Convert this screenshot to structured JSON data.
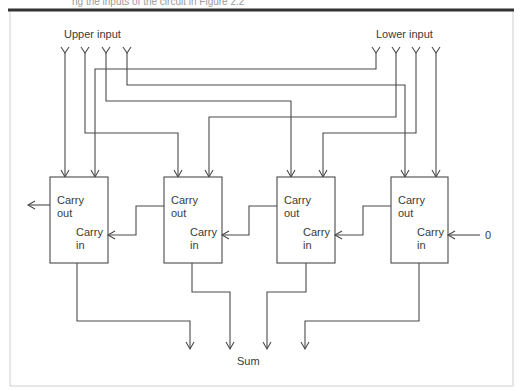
{
  "caption": "ng the inputs of the circuit in Figure 2.2",
  "labels": {
    "upper_input": "Upper input",
    "lower_input": "Lower input",
    "sum": "Sum",
    "carry_in_zero": "0"
  },
  "adders": [
    {
      "carry_out": "Carry",
      "carry_out2": "out",
      "carry_in": "Carry",
      "carry_in2": "in"
    },
    {
      "carry_out": "Carry",
      "carry_out2": "out",
      "carry_in": "Carry",
      "carry_in2": "in"
    },
    {
      "carry_out": "Carry",
      "carry_out2": "out",
      "carry_in": "Carry",
      "carry_in2": "in"
    },
    {
      "carry_out": "Carry",
      "carry_out2": "out",
      "carry_in": "Carry",
      "carry_in2": "in"
    }
  ],
  "colors": {
    "line": "#4a4a4a",
    "frame_top": "#333333",
    "frame_border": "#cccccc"
  }
}
